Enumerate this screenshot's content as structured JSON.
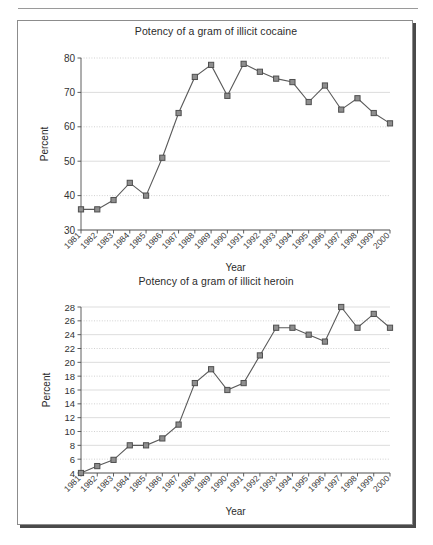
{
  "page": {
    "header_rule_visible": true,
    "header_ghost_text": ""
  },
  "figure": {
    "frame_border_color": "#8c8c8c",
    "shadow_color": "#4a4a4a",
    "background": "#ffffff"
  },
  "style": {
    "marker_fill": "#8e8e8e",
    "marker_stroke": "#4f4f4f",
    "line_color": "#5a5a5a",
    "grid_color": "#cfcfcf",
    "axis_color": "#4d4d4d",
    "text_color": "#2b2b2b"
  },
  "chart_data": [
    {
      "id": "cocaine",
      "type": "line",
      "title": "Potency of a gram of illicit cocaine",
      "xlabel": "Year",
      "ylabel": "Percent",
      "categories": [
        "1981",
        "1982",
        "1983",
        "1984",
        "1985",
        "1986",
        "1987",
        "1988",
        "1989",
        "1990",
        "1991",
        "1992",
        "1993",
        "1994",
        "1995",
        "1996",
        "1997",
        "1998",
        "1999",
        "2000"
      ],
      "values": [
        36,
        36,
        38.7,
        43.7,
        40,
        51,
        64,
        74.5,
        78,
        69,
        78.3,
        76,
        74,
        73,
        67.2,
        72,
        65,
        68.3,
        64,
        61
      ],
      "ylim": [
        30,
        80
      ],
      "ytick_step": 10,
      "yticks": [
        30,
        40,
        50,
        60,
        70,
        80
      ],
      "grid": true,
      "legend": "none",
      "marker": "square"
    },
    {
      "id": "heroin",
      "type": "line",
      "title": "Potency of a gram of illicit heroin",
      "xlabel": "Year",
      "ylabel": "Percent",
      "categories": [
        "1981",
        "1982",
        "1983",
        "1984",
        "1985",
        "1986",
        "1987",
        "1988",
        "1989",
        "1990",
        "1991",
        "1992",
        "1993",
        "1994",
        "1995",
        "1996",
        "1997",
        "1998",
        "1999",
        "2000"
      ],
      "values": [
        4,
        5,
        5.9,
        8,
        8,
        9,
        11,
        17,
        19,
        16,
        17,
        21,
        25,
        25,
        24,
        23,
        28,
        25,
        27,
        25
      ],
      "ylim": [
        4,
        28
      ],
      "ytick_step": 2,
      "yticks": [
        4,
        6,
        8,
        10,
        12,
        14,
        16,
        18,
        20,
        22,
        24,
        26,
        28
      ],
      "grid": true,
      "legend": "none",
      "marker": "square"
    }
  ]
}
